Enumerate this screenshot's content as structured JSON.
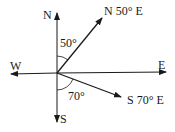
{
  "diagram": {
    "type": "compass bearings",
    "labels": {
      "north": "N",
      "south": "S",
      "east": "E",
      "west": "W",
      "bearing1": "N 50° E",
      "bearing2": "S 70° E",
      "angle1": "50°",
      "angle2": "70°"
    },
    "colors": {
      "ink": "#1a1a1a",
      "background": "#ffffff"
    }
  }
}
